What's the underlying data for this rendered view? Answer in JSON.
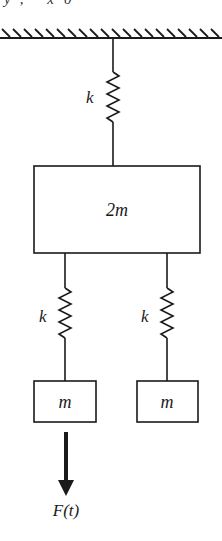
{
  "diagram": {
    "title_fragment": "y, x0",
    "ground": {
      "label": "fixed-support"
    },
    "springs": [
      {
        "id": "top-spring",
        "label": "k"
      },
      {
        "id": "left-spring",
        "label": "k"
      },
      {
        "id": "right-spring",
        "label": "k"
      }
    ],
    "masses": [
      {
        "id": "big-mass",
        "label": "2m"
      },
      {
        "id": "left-mass",
        "label": "m"
      },
      {
        "id": "right-mass",
        "label": "m"
      }
    ],
    "force": {
      "label": "F(t)"
    },
    "colors": {
      "stroke": "#1a1a1a",
      "background": "#ffffff"
    }
  }
}
